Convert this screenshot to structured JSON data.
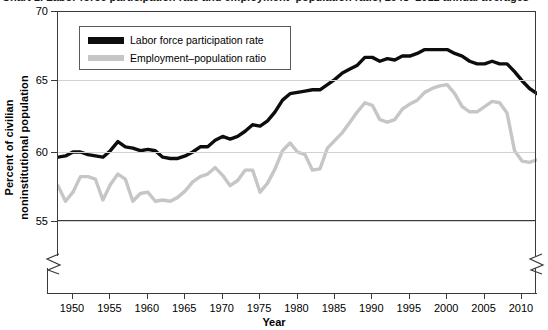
{
  "figure": {
    "clipped_caption": "Chart 1. Labor force participation rate and employment–population ratio, 1948–2012 annual averages"
  },
  "axes": {
    "ytitle_line1": "Percent of civilian",
    "ytitle_line2": "noninstitutional population",
    "xtitle": "Year",
    "yticks": [
      "70",
      "65",
      "60",
      "55"
    ],
    "xticks": [
      "1950",
      "1955",
      "1960",
      "1965",
      "1970",
      "1975",
      "1980",
      "1985",
      "1990",
      "1995",
      "2000",
      "2005",
      "2010"
    ]
  },
  "legend": {
    "items": [
      {
        "label": "Labor force participation rate",
        "color": "#0d0d0d"
      },
      {
        "label": "Employment–population ratio",
        "color": "#c6c6c6"
      }
    ]
  },
  "chart_data": {
    "type": "line",
    "title": "Labor force participation rate and employment–population ratio",
    "xlabel": "Year",
    "ylabel": "Percent of civilian noninstitutional population",
    "xlim": [
      1948,
      2012
    ],
    "ylim": [
      53.8,
      70
    ],
    "ytick_values": [
      55,
      60,
      65,
      70
    ],
    "xtick_values": [
      1950,
      1955,
      1960,
      1965,
      1970,
      1975,
      1980,
      1985,
      1990,
      1995,
      2000,
      2005,
      2010
    ],
    "grid": "horizontal",
    "legend_position": "upper-left-inside",
    "axis_break": "both x-axis ends and y-axis origin are broken (zigzag)",
    "x": [
      1948,
      1949,
      1950,
      1951,
      1952,
      1953,
      1954,
      1955,
      1956,
      1957,
      1958,
      1959,
      1960,
      1961,
      1962,
      1963,
      1964,
      1965,
      1966,
      1967,
      1968,
      1969,
      1970,
      1971,
      1972,
      1973,
      1974,
      1975,
      1976,
      1977,
      1978,
      1979,
      1980,
      1981,
      1982,
      1983,
      1984,
      1985,
      1986,
      1987,
      1988,
      1989,
      1990,
      1991,
      1992,
      1993,
      1994,
      1995,
      1996,
      1997,
      1998,
      1999,
      2000,
      2001,
      2002,
      2003,
      2004,
      2005,
      2006,
      2007,
      2008,
      2009,
      2010,
      2011,
      2012
    ],
    "series": [
      {
        "name": "Labor force participation rate",
        "color": "#0d0d0d",
        "values": [
          58.8,
          58.9,
          59.2,
          59.2,
          59.0,
          58.9,
          58.8,
          59.3,
          60.0,
          59.6,
          59.5,
          59.3,
          59.4,
          59.3,
          58.8,
          58.7,
          58.7,
          58.9,
          59.2,
          59.6,
          59.6,
          60.1,
          60.4,
          60.2,
          60.4,
          60.8,
          61.3,
          61.2,
          61.6,
          62.3,
          63.2,
          63.7,
          63.8,
          63.9,
          64.0,
          64.0,
          64.4,
          64.8,
          65.3,
          65.6,
          65.9,
          66.5,
          66.5,
          66.2,
          66.4,
          66.3,
          66.6,
          66.6,
          66.8,
          67.1,
          67.1,
          67.1,
          67.1,
          66.8,
          66.6,
          66.2,
          66.0,
          66.0,
          66.2,
          66.0,
          66.0,
          65.4,
          64.7,
          64.1,
          63.7
        ]
      },
      {
        "name": "Employment–population ratio",
        "color": "#c6c6c6",
        "values": [
          56.6,
          55.4,
          56.1,
          57.3,
          57.3,
          57.1,
          55.5,
          56.7,
          57.5,
          57.1,
          55.4,
          56.0,
          56.1,
          55.4,
          55.5,
          55.4,
          55.7,
          56.2,
          56.9,
          57.3,
          57.5,
          58.0,
          57.4,
          56.6,
          57.0,
          57.8,
          57.8,
          56.1,
          56.8,
          57.9,
          59.3,
          59.9,
          59.2,
          59.0,
          57.8,
          57.9,
          59.5,
          60.1,
          60.7,
          61.5,
          62.3,
          63.0,
          62.8,
          61.7,
          61.5,
          61.7,
          62.5,
          62.9,
          63.2,
          63.8,
          64.1,
          64.3,
          64.4,
          63.7,
          62.7,
          62.3,
          62.3,
          62.7,
          63.1,
          63.0,
          62.2,
          59.3,
          58.5,
          58.4,
          58.6
        ]
      }
    ]
  }
}
